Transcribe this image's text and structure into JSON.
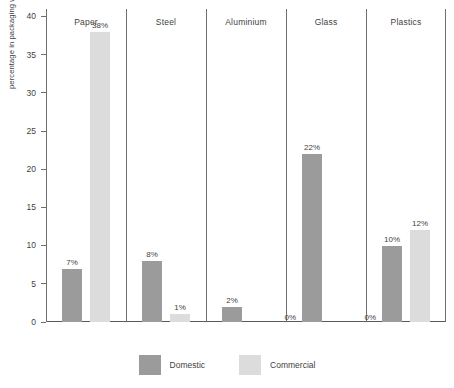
{
  "chart_data": {
    "type": "bar",
    "title": "",
    "subtitle": "",
    "xlabel": "",
    "ylabel": "percentage in packaging waste stream",
    "ylim": [
      0,
      41
    ],
    "yticks": [
      0,
      5,
      10,
      15,
      20,
      25,
      30,
      35,
      40
    ],
    "grid": false,
    "legend_position": "bottom-center",
    "categories": [
      "Paper",
      "Steel",
      "Aluminium",
      "Glass",
      "Plastics"
    ],
    "series": [
      {
        "name": "Domestic",
        "color": "#9b9b9b",
        "values": [
          7,
          8,
          2,
          22,
          10
        ],
        "labels": [
          "7%",
          "8%",
          "2%",
          "22%",
          "10%"
        ]
      },
      {
        "name": "Commercial",
        "color": "#dcdcdc",
        "values": [
          38,
          1,
          0,
          0,
          12
        ],
        "labels": [
          "38%",
          "1%",
          "0%",
          "0%",
          "12%"
        ]
      }
    ]
  },
  "axis": {
    "y_label": "percentage in packaging waste stream",
    "tick_labels": [
      "40",
      "35",
      "30",
      "25",
      "20",
      "15",
      "10",
      "5",
      "0"
    ]
  },
  "legend": {
    "items": [
      {
        "label": "Domestic",
        "color": "#9b9b9b",
        "swatch": "legend-swatch-domestic"
      },
      {
        "label": "Commercial",
        "color": "#dcdcdc",
        "swatch": "legend-swatch-commercial"
      }
    ]
  },
  "panels": {
    "headers": [
      "Paper",
      "Steel",
      "Aluminium",
      "Glass",
      "Plastics"
    ]
  },
  "colors": {
    "domestic": "#9b9b9b",
    "commercial": "#dcdcdc",
    "axis_line": "#6f6f6f",
    "baseline": "#5a5a5a",
    "text": "#3f3f3f",
    "background": "#ffffff"
  }
}
